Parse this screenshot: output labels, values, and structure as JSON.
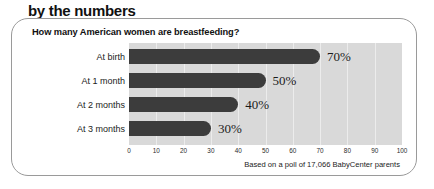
{
  "kicker": {
    "text": "by the numbers"
  },
  "panel": {
    "title": "How many American women are breastfeeding?",
    "source_note": "Based on a poll of 17,066 BabyCenter parents"
  },
  "colors": {
    "bar": "#3c3c3c",
    "plot_background": "#d9d9d9",
    "gridline": "#ececec",
    "panel_border": "#9a9a9a",
    "text": "#1b1b1b",
    "rule": "#4a4a4a"
  },
  "chart_data": {
    "type": "bar",
    "orientation": "horizontal",
    "title": "How many American women are breastfeeding?",
    "xlabel": "",
    "ylabel": "",
    "categories": [
      "At birth",
      "At 1 month",
      "At 2 months",
      "At 3 months"
    ],
    "values": [
      70,
      50,
      40,
      30
    ],
    "data_labels": [
      "70%",
      "50%",
      "40%",
      "30%"
    ],
    "xlim": [
      0,
      100
    ],
    "xticks": [
      0,
      10,
      20,
      30,
      40,
      50,
      60,
      70,
      80,
      90,
      100
    ],
    "xtick_labels": [
      "0",
      "10",
      "20",
      "30",
      "40",
      "50",
      "60",
      "70",
      "80",
      "90",
      "100"
    ],
    "grid": true,
    "grid_axis": "x",
    "legend": false,
    "annotation": "Based on a poll of 17,066 BabyCenter parents"
  }
}
